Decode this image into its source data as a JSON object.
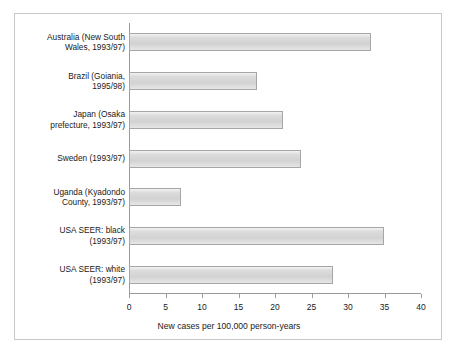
{
  "chart_data": {
    "type": "bar",
    "orientation": "horizontal",
    "title": "",
    "xlabel": "New cases per 100,000 person-years",
    "ylabel": "",
    "xlim": [
      0,
      40
    ],
    "xticks": [
      "0",
      "5",
      "10",
      "15",
      "20",
      "25",
      "30",
      "35",
      "40"
    ],
    "xtick_values": [
      0,
      5,
      10,
      15,
      20,
      25,
      30,
      35,
      40
    ],
    "grid": false,
    "legend": false,
    "categories": [
      "Australia (New South\nWales, 1993/97)",
      "Brazil (Goiania,\n1995/98)",
      "Japan (Osaka\nprefecture, 1993/97)",
      "Sweden (1993/97)",
      "Uganda (Kyadondo\nCounty, 1993/97)",
      "USA SEER: black\n(1993/97)",
      "USA SEER: white\n(1993/97)"
    ],
    "values": [
      33.1,
      17.5,
      21.1,
      23.5,
      7.1,
      34.9,
      28.0
    ],
    "bar_color": "#d9d9d9",
    "bar_border_color": "#a6a6a6",
    "axis_color": "#9a9a9a",
    "text_color": "#1a1a1a"
  }
}
